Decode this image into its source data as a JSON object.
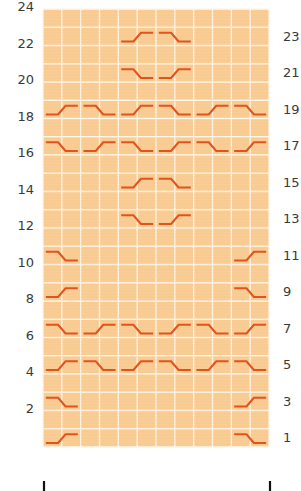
{
  "chart": {
    "columns": 12,
    "rows": 24,
    "colors": {
      "cell": "#F9CD95",
      "grid_line": "#FFF6EA",
      "cable_stroke": "#E2541C",
      "label": "#3a3a3a",
      "repeat_tick": "#111111"
    },
    "left_labels": [
      "2",
      "4",
      "6",
      "8",
      "10",
      "12",
      "14",
      "16",
      "18",
      "20",
      "22",
      "24"
    ],
    "right_labels": [
      "1",
      "3",
      "5",
      "7",
      "9",
      "11",
      "13",
      "15",
      "17",
      "19",
      "21",
      "23"
    ],
    "symbol_legend": {
      "up": "cross rising left-to-right (low-left to high-right)",
      "down": "cross falling left-to-right (high-left to low-right)"
    },
    "cables": [
      {
        "row": 1,
        "start_col": 1,
        "type": "up"
      },
      {
        "row": 1,
        "start_col": 11,
        "type": "down"
      },
      {
        "row": 3,
        "start_col": 1,
        "type": "down"
      },
      {
        "row": 3,
        "start_col": 11,
        "type": "up"
      },
      {
        "row": 5,
        "start_col": 1,
        "type": "up"
      },
      {
        "row": 5,
        "start_col": 3,
        "type": "down"
      },
      {
        "row": 5,
        "start_col": 5,
        "type": "up"
      },
      {
        "row": 5,
        "start_col": 7,
        "type": "down"
      },
      {
        "row": 5,
        "start_col": 9,
        "type": "up"
      },
      {
        "row": 5,
        "start_col": 11,
        "type": "down"
      },
      {
        "row": 7,
        "start_col": 1,
        "type": "down"
      },
      {
        "row": 7,
        "start_col": 3,
        "type": "up"
      },
      {
        "row": 7,
        "start_col": 5,
        "type": "down"
      },
      {
        "row": 7,
        "start_col": 7,
        "type": "up"
      },
      {
        "row": 7,
        "start_col": 9,
        "type": "down"
      },
      {
        "row": 7,
        "start_col": 11,
        "type": "up"
      },
      {
        "row": 9,
        "start_col": 1,
        "type": "up"
      },
      {
        "row": 9,
        "start_col": 11,
        "type": "down"
      },
      {
        "row": 11,
        "start_col": 1,
        "type": "down"
      },
      {
        "row": 11,
        "start_col": 11,
        "type": "up"
      },
      {
        "row": 13,
        "start_col": 5,
        "type": "down"
      },
      {
        "row": 13,
        "start_col": 7,
        "type": "up"
      },
      {
        "row": 15,
        "start_col": 5,
        "type": "up"
      },
      {
        "row": 15,
        "start_col": 7,
        "type": "down"
      },
      {
        "row": 17,
        "start_col": 1,
        "type": "down"
      },
      {
        "row": 17,
        "start_col": 3,
        "type": "up"
      },
      {
        "row": 17,
        "start_col": 5,
        "type": "down"
      },
      {
        "row": 17,
        "start_col": 7,
        "type": "up"
      },
      {
        "row": 17,
        "start_col": 9,
        "type": "down"
      },
      {
        "row": 17,
        "start_col": 11,
        "type": "up"
      },
      {
        "row": 19,
        "start_col": 1,
        "type": "up"
      },
      {
        "row": 19,
        "start_col": 3,
        "type": "down"
      },
      {
        "row": 19,
        "start_col": 5,
        "type": "up"
      },
      {
        "row": 19,
        "start_col": 7,
        "type": "down"
      },
      {
        "row": 19,
        "start_col": 9,
        "type": "up"
      },
      {
        "row": 19,
        "start_col": 11,
        "type": "down"
      },
      {
        "row": 21,
        "start_col": 5,
        "type": "down"
      },
      {
        "row": 21,
        "start_col": 7,
        "type": "up"
      },
      {
        "row": 23,
        "start_col": 5,
        "type": "up"
      },
      {
        "row": 23,
        "start_col": 7,
        "type": "down"
      }
    ],
    "repeat_marks": [
      "left-edge",
      "right-edge"
    ]
  }
}
